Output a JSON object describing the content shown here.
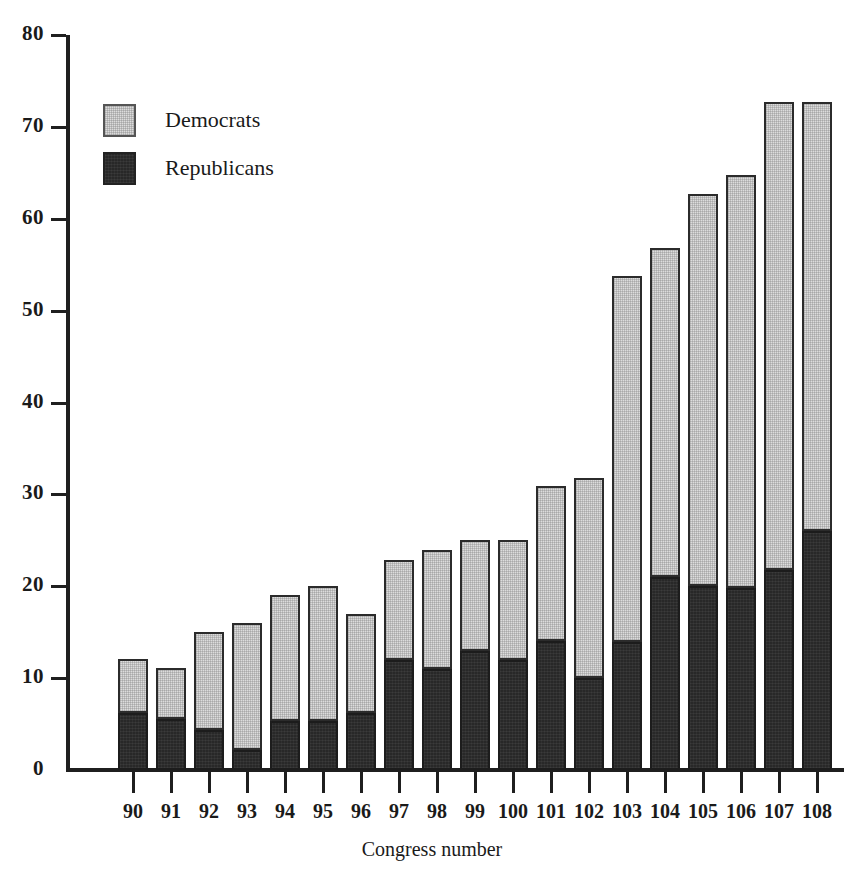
{
  "chart_data": {
    "type": "bar",
    "stacked": true,
    "title": "",
    "xlabel": "Congress number",
    "ylabel": "",
    "ylim": [
      0,
      80
    ],
    "yticks": [
      0,
      10,
      20,
      30,
      40,
      50,
      60,
      70,
      80
    ],
    "grid": false,
    "legend_position": "top-left",
    "categories": [
      "90",
      "91",
      "92",
      "93",
      "94",
      "95",
      "96",
      "97",
      "98",
      "99",
      "100",
      "101",
      "102",
      "103",
      "104",
      "105",
      "106",
      "107",
      "108"
    ],
    "series": [
      {
        "name": "Republicans",
        "color": "#282828",
        "values": [
          6.2,
          5.5,
          4.3,
          2.2,
          5.3,
          5.3,
          6.2,
          12.0,
          11.0,
          13.0,
          12.0,
          14.0,
          10.0,
          13.9,
          21.0,
          20.0,
          19.8,
          21.8,
          26.0
        ]
      },
      {
        "name": "Democrats",
        "color": "#dcdcdc",
        "values": [
          5.9,
          5.6,
          10.7,
          13.8,
          13.7,
          14.7,
          10.8,
          10.9,
          13.0,
          12.0,
          13.0,
          16.9,
          21.8,
          39.9,
          35.8,
          42.7,
          45.0,
          50.9,
          46.7
        ]
      }
    ],
    "totals": [
      12.1,
      11.1,
      15.0,
      16.0,
      19.0,
      20.0,
      17.0,
      22.9,
      24.0,
      25.0,
      25.0,
      30.9,
      31.8,
      53.8,
      56.8,
      62.7,
      64.8,
      72.7,
      72.7
    ],
    "legend": [
      {
        "label": "Democrats",
        "key": "dem"
      },
      {
        "label": "Republicans",
        "key": "rep"
      }
    ]
  }
}
